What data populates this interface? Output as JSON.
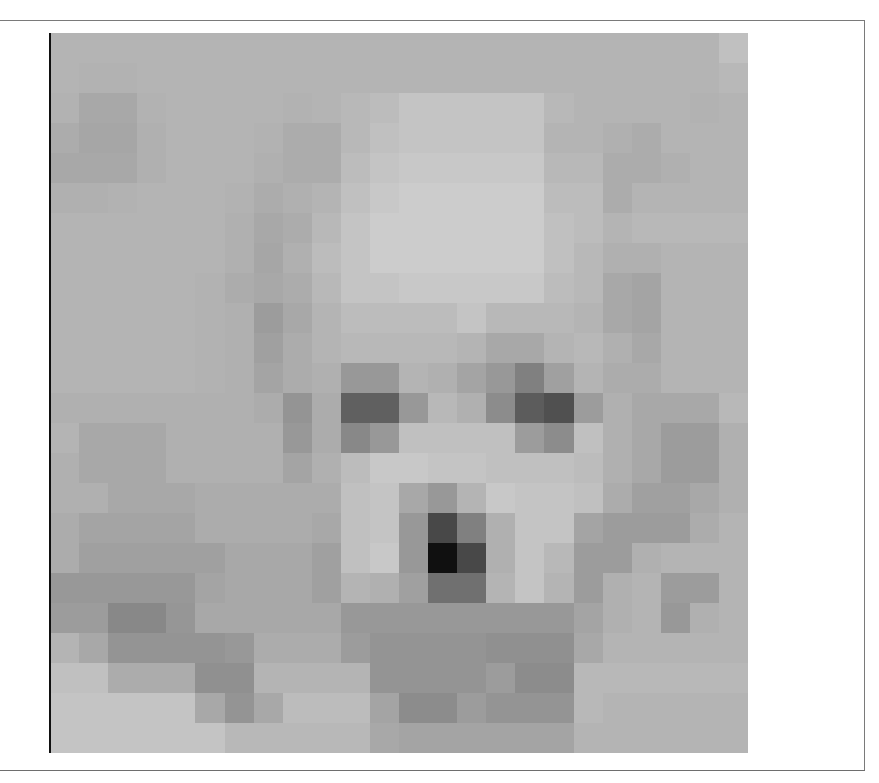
{
  "figure": {
    "grid_size": [
      24,
      24
    ],
    "caption_partial": "",
    "pixels": [
      [
        "b4",
        "b4",
        "b4",
        "b4",
        "b4",
        "b4",
        "b4",
        "b4",
        "b4",
        "b4",
        "b4",
        "b4",
        "b4",
        "b4",
        "b4",
        "b4",
        "b4",
        "b4",
        "b4",
        "b4",
        "b4",
        "b4",
        "b4",
        "c0"
      ],
      [
        "b4",
        "b2",
        "b2",
        "b4",
        "b4",
        "b4",
        "b4",
        "b4",
        "b4",
        "b4",
        "b4",
        "b4",
        "b4",
        "b4",
        "b4",
        "b4",
        "b4",
        "b4",
        "b4",
        "b4",
        "b4",
        "b4",
        "b4",
        "b8"
      ],
      [
        "b2",
        "a8",
        "a8",
        "b2",
        "b4",
        "b4",
        "b4",
        "b4",
        "b2",
        "b4",
        "b8",
        "bc",
        "c4",
        "c4",
        "c4",
        "c4",
        "c4",
        "b8",
        "b4",
        "b4",
        "b4",
        "b4",
        "b2",
        "b4"
      ],
      [
        "ac",
        "a6",
        "a6",
        "b0",
        "b4",
        "b4",
        "b4",
        "b2",
        "ac",
        "ac",
        "b8",
        "c0",
        "c4",
        "c4",
        "c4",
        "c4",
        "c4",
        "b4",
        "b4",
        "b0",
        "ac",
        "b4",
        "b4",
        "b4"
      ],
      [
        "a8",
        "a8",
        "a8",
        "b0",
        "b4",
        "b4",
        "b4",
        "b0",
        "ac",
        "ac",
        "bc",
        "c4",
        "c8",
        "c8",
        "c8",
        "c8",
        "c8",
        "b8",
        "b8",
        "ac",
        "ac",
        "b0",
        "b4",
        "b4"
      ],
      [
        "b0",
        "b0",
        "b2",
        "b4",
        "b4",
        "b4",
        "b2",
        "ac",
        "b0",
        "b4",
        "c0",
        "c8",
        "cc",
        "cc",
        "cc",
        "cc",
        "cc",
        "bc",
        "bc",
        "ac",
        "b4",
        "b4",
        "b4",
        "b4"
      ],
      [
        "b4",
        "b4",
        "b4",
        "b4",
        "b4",
        "b4",
        "b0",
        "a8",
        "ac",
        "b8",
        "c4",
        "cc",
        "cc",
        "cc",
        "cc",
        "cc",
        "cc",
        "c0",
        "bc",
        "b4",
        "b8",
        "b8",
        "b8",
        "b8"
      ],
      [
        "b4",
        "b4",
        "b4",
        "b4",
        "b4",
        "b4",
        "b0",
        "a6",
        "b0",
        "bc",
        "c4",
        "cc",
        "cc",
        "cc",
        "cc",
        "cc",
        "cc",
        "c0",
        "b8",
        "b0",
        "b0",
        "b4",
        "b4",
        "b4"
      ],
      [
        "b4",
        "b4",
        "b4",
        "b4",
        "b4",
        "b2",
        "ac",
        "a8",
        "ac",
        "b8",
        "c4",
        "c4",
        "c8",
        "c8",
        "c8",
        "c8",
        "c8",
        "bc",
        "b8",
        "a8",
        "a4",
        "b4",
        "b4",
        "b4"
      ],
      [
        "b4",
        "b4",
        "b4",
        "b4",
        "b4",
        "b2",
        "b0",
        "9c",
        "a8",
        "b4",
        "bc",
        "bc",
        "bc",
        "bc",
        "c4",
        "b8",
        "b8",
        "b8",
        "b4",
        "a8",
        "a4",
        "b4",
        "b4",
        "b4"
      ],
      [
        "b4",
        "b4",
        "b4",
        "b4",
        "b4",
        "b2",
        "b0",
        "a0",
        "ac",
        "b4",
        "b8",
        "b8",
        "b8",
        "b8",
        "b4",
        "a8",
        "a8",
        "b4",
        "b8",
        "b0",
        "a8",
        "b4",
        "b4",
        "b4"
      ],
      [
        "b4",
        "b4",
        "b4",
        "b4",
        "b4",
        "b2",
        "b0",
        "a4",
        "ac",
        "b0",
        "98",
        "98",
        "b4",
        "b0",
        "a4",
        "98",
        "80",
        "a0",
        "b4",
        "ac",
        "ac",
        "b4",
        "b4",
        "b4"
      ],
      [
        "b0",
        "b0",
        "b0",
        "b0",
        "b0",
        "b0",
        "b0",
        "ac",
        "94",
        "ac",
        "60",
        "60",
        "98",
        "b8",
        "b0",
        "8c",
        "5c",
        "50",
        "9c",
        "b0",
        "a8",
        "a8",
        "a8",
        "b8"
      ],
      [
        "b4",
        "a8",
        "a8",
        "a8",
        "b0",
        "b0",
        "b0",
        "b0",
        "98",
        "ac",
        "88",
        "98",
        "c0",
        "c0",
        "c0",
        "c0",
        "9c",
        "8c",
        "c0",
        "b0",
        "a8",
        "9c",
        "9c",
        "b0"
      ],
      [
        "b0",
        "a8",
        "a8",
        "a8",
        "b0",
        "b0",
        "b0",
        "b0",
        "a4",
        "b0",
        "bc",
        "c8",
        "c8",
        "c4",
        "c4",
        "c0",
        "c0",
        "c0",
        "bc",
        "b0",
        "a8",
        "9c",
        "9c",
        "b0"
      ],
      [
        "b0",
        "b0",
        "a8",
        "a8",
        "a8",
        "ac",
        "ac",
        "ac",
        "ac",
        "ac",
        "c0",
        "c4",
        "a8",
        "98",
        "b4",
        "c8",
        "c4",
        "c4",
        "c0",
        "ac",
        "a0",
        "a0",
        "a8",
        "b0"
      ],
      [
        "ac",
        "a4",
        "a4",
        "a4",
        "a4",
        "ac",
        "ac",
        "ac",
        "ac",
        "a8",
        "c0",
        "c4",
        "98",
        "48",
        "80",
        "b0",
        "c4",
        "c4",
        "a4",
        "9c",
        "9c",
        "9c",
        "ac",
        "b4"
      ],
      [
        "ac",
        "a0",
        "a0",
        "a0",
        "a0",
        "a0",
        "a8",
        "a8",
        "a8",
        "a0",
        "c0",
        "c8",
        "98",
        "10",
        "48",
        "b0",
        "c4",
        "b8",
        "9c",
        "9c",
        "b0",
        "b4",
        "b4",
        "b4"
      ],
      [
        "98",
        "98",
        "98",
        "98",
        "98",
        "a4",
        "a8",
        "a8",
        "a8",
        "a0",
        "b4",
        "b0",
        "a0",
        "70",
        "70",
        "b4",
        "c4",
        "b4",
        "9c",
        "b0",
        "b4",
        "9c",
        "9c",
        "b4"
      ],
      [
        "9c",
        "9c",
        "88",
        "88",
        "96",
        "a8",
        "a8",
        "a8",
        "a8",
        "a8",
        "98",
        "98",
        "98",
        "98",
        "98",
        "98",
        "98",
        "98",
        "a4",
        "b0",
        "b4",
        "98",
        "b0",
        "b4"
      ],
      [
        "b4",
        "a8",
        "94",
        "94",
        "94",
        "94",
        "98",
        "ac",
        "ac",
        "ac",
        "9c",
        "94",
        "94",
        "94",
        "94",
        "90",
        "90",
        "90",
        "a8",
        "b4",
        "b4",
        "b4",
        "b4",
        "b4"
      ],
      [
        "c0",
        "c0",
        "ac",
        "ac",
        "ac",
        "90",
        "90",
        "b4",
        "b4",
        "b4",
        "b4",
        "94",
        "94",
        "94",
        "94",
        "9c",
        "8c",
        "8c",
        "b8",
        "b8",
        "b8",
        "b8",
        "b8",
        "b8"
      ],
      [
        "c4",
        "c4",
        "c4",
        "c4",
        "c4",
        "a8",
        "94",
        "a8",
        "bc",
        "bc",
        "bc",
        "a4",
        "8c",
        "8c",
        "9c",
        "94",
        "94",
        "94",
        "b8",
        "b4",
        "b4",
        "b4",
        "b4",
        "b4"
      ],
      [
        "c4",
        "c4",
        "c4",
        "c4",
        "c4",
        "c4",
        "b8",
        "b8",
        "b8",
        "b8",
        "b8",
        "a8",
        "a4",
        "a4",
        "a4",
        "a4",
        "a4",
        "a4",
        "b4",
        "b4",
        "b4",
        "b4",
        "b4",
        "b4"
      ]
    ]
  }
}
